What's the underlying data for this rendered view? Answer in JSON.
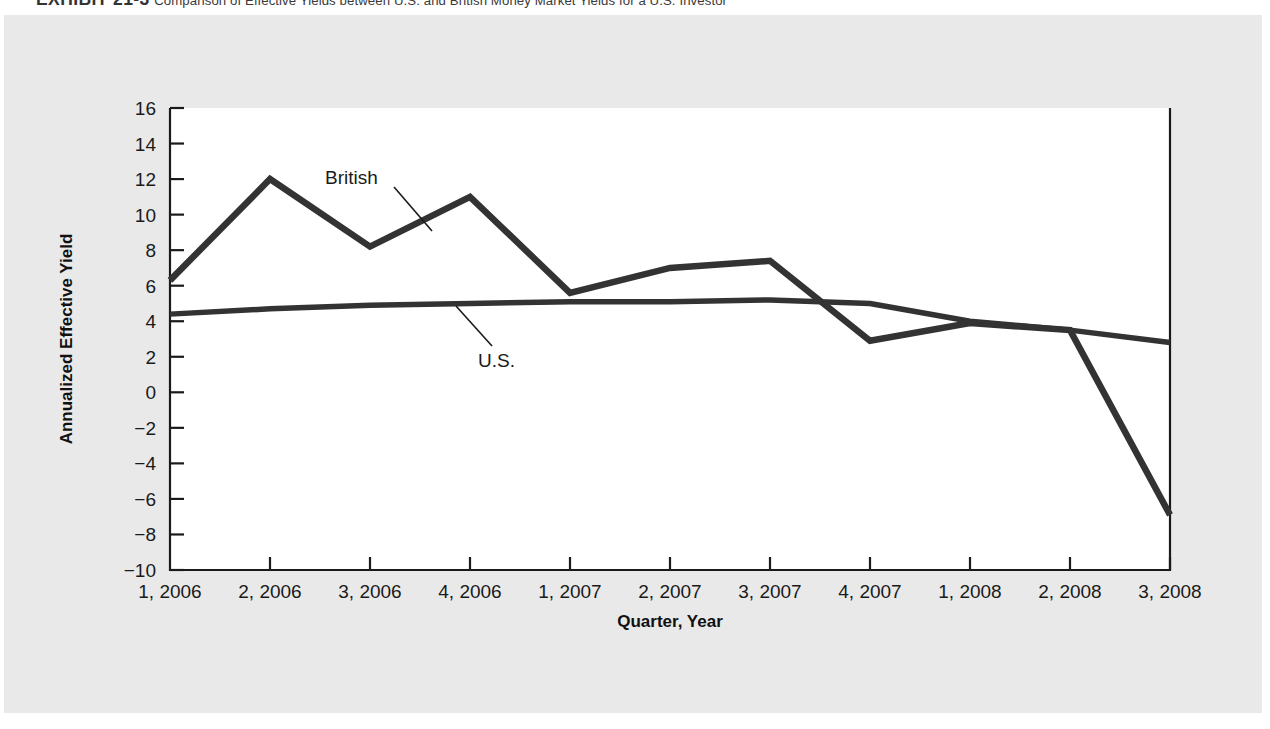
{
  "caption": {
    "exhibit_label": "EXHIBIT 21-3",
    "text": "Comparison of Effective Yields between U.S. and British Money Market Yields for a U.S. Investor"
  },
  "colors": {
    "figure_background": "#e9e9e9",
    "plot_background": "#ffffff",
    "line_color": "#333333",
    "axis_color": "#1a1a1a",
    "text_color": "#1a1a1a"
  },
  "chart_data": {
    "type": "line",
    "title": "Comparison of Effective Yields between U.S. and British Money Market Yields for a U.S. Investor",
    "xlabel": "Quarter, Year",
    "ylabel": "Annualized Effective Yield",
    "categories": [
      "1, 2006",
      "2, 2006",
      "3, 2006",
      "4, 2006",
      "1, 2007",
      "2, 2007",
      "3, 2007",
      "4, 2007",
      "1, 2008",
      "2, 2008",
      "3, 2008"
    ],
    "ylim": [
      -10,
      16
    ],
    "yticks": [
      16,
      14,
      12,
      10,
      8,
      6,
      4,
      2,
      0,
      -2,
      -4,
      -6,
      -8,
      -10
    ],
    "ytick_labels": [
      "16",
      "14",
      "12",
      "10",
      "8",
      "6",
      "4",
      "2",
      "0",
      "−2",
      "−4",
      "−6",
      "−8",
      "−10"
    ],
    "grid": false,
    "legend": "inline-annotations",
    "series": [
      {
        "name": "British",
        "values": [
          6.3,
          12.0,
          8.2,
          11.0,
          5.6,
          7.0,
          7.4,
          2.9,
          3.9,
          3.5,
          -6.9
        ]
      },
      {
        "name": "U.S.",
        "values": [
          4.4,
          4.7,
          4.9,
          5.0,
          5.1,
          5.1,
          5.2,
          5.0,
          4.0,
          3.5,
          2.8
        ]
      }
    ],
    "annotations": [
      {
        "text": "British",
        "series": "British"
      },
      {
        "text": "U.S.",
        "series": "U.S."
      }
    ]
  }
}
